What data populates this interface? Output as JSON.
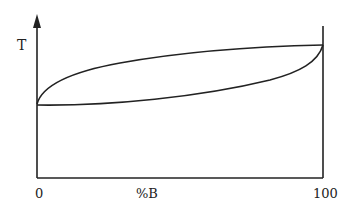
{
  "diagram": {
    "type": "binary-phase-diagram",
    "y_axis_label": "T",
    "x_axis_label": "%B",
    "x_tick_left": "0",
    "x_tick_right": "100",
    "curves": [
      {
        "name": "liquidus",
        "description": "upper concave-down curve from left axis to right axis"
      },
      {
        "name": "solidus",
        "description": "lower concave-up curve from left axis to right axis"
      }
    ],
    "line_color": "#222222"
  }
}
